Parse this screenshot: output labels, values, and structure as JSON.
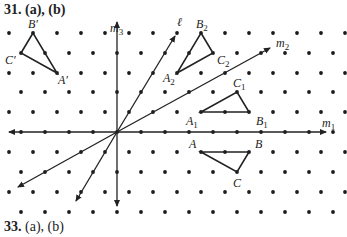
{
  "headings": {
    "top": {
      "number": "31.",
      "parts": "(a), (b)"
    },
    "bottom": {
      "number": "33.",
      "parts": "(a), (b)"
    }
  },
  "grid": {
    "rows_y": [
      33,
      53,
      73,
      92,
      112,
      132,
      152,
      172,
      192,
      212
    ],
    "odd_row_x_start": 9,
    "even_row_x_start": 21,
    "x_spacing": 24,
    "dot_color": "#1a1a1a"
  },
  "axes": {
    "m1": {
      "label": "m",
      "sub": "1"
    },
    "m2": {
      "label": "m",
      "sub": "2"
    },
    "m3": {
      "label": "m",
      "sub": "3"
    },
    "l": {
      "label": "ℓ"
    }
  },
  "triangles": {
    "prime": {
      "A": "A′",
      "B": "B′",
      "C": "C′"
    },
    "t2": {
      "A": "A",
      "B": "B",
      "C": "C",
      "sub": "2"
    },
    "t1": {
      "A": "A",
      "B": "B",
      "C": "C",
      "sub": "1"
    },
    "orig": {
      "A": "A",
      "B": "B",
      "C": "C"
    }
  },
  "colors": {
    "ink": "#222222",
    "background": "#ffffff"
  }
}
